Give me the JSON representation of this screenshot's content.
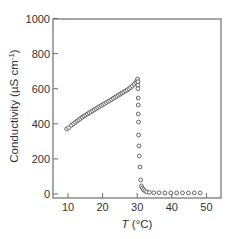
{
  "chart_data": {
    "type": "scatter",
    "title": "",
    "xlabel": "T (°C)",
    "xlabel_parts": {
      "var": "T",
      "unit": " (°C)"
    },
    "ylabel": "Conductivity (µS cm⁻¹)",
    "ylabel_parts": {
      "main": "Conductivity (µS cm",
      "sup": "-1",
      "close": ")"
    },
    "xlim": [
      5.5,
      53
    ],
    "ylim": [
      -10,
      1000
    ],
    "xticks": [
      10,
      20,
      30,
      40,
      50
    ],
    "yticks": [
      0,
      200,
      400,
      600,
      800,
      1000
    ],
    "grid": false,
    "legend": null,
    "marker": "open-circle",
    "color": "#555555",
    "series": [
      {
        "name": "conductivity",
        "x": [
          9.6,
          10.2,
          11.0,
          11.6,
          12.1,
          12.6,
          13.1,
          13.6,
          14.1,
          14.6,
          15.1,
          15.6,
          16.1,
          16.6,
          17.1,
          17.6,
          18.1,
          18.6,
          19.1,
          19.6,
          20.1,
          20.6,
          21.1,
          21.6,
          22.1,
          22.6,
          23.1,
          23.6,
          24.1,
          24.6,
          25.1,
          25.6,
          26.1,
          26.6,
          27.1,
          27.6,
          28.1,
          28.6,
          29.1,
          29.6,
          29.9,
          30.1,
          30.2,
          30.2,
          30.2,
          30.3,
          30.3,
          30.3,
          30.4,
          30.4,
          30.5,
          30.6,
          30.8,
          31.0,
          31.2,
          31.5,
          31.8,
          32.2,
          32.7,
          33.5,
          34.8,
          36.3,
          38.0,
          39.7,
          41.4,
          43.1,
          44.8,
          46.5,
          48.2
        ],
        "y": [
          370,
          378,
          392,
          400,
          408,
          415,
          422,
          430,
          437,
          444,
          450,
          456,
          462,
          468,
          474,
          480,
          486,
          492,
          498,
          504,
          510,
          515,
          521,
          527,
          533,
          539,
          545,
          551,
          557,
          563,
          569,
          575,
          581,
          587,
          593,
          600,
          607,
          615,
          625,
          635,
          645,
          655,
          640,
          620,
          600,
          547,
          507,
          456,
          410,
          336,
          274,
          217,
          154,
          80,
          46,
          34,
          25,
          18,
          12,
          9,
          7,
          7,
          6,
          6,
          6,
          6,
          6,
          6,
          6
        ]
      }
    ]
  }
}
